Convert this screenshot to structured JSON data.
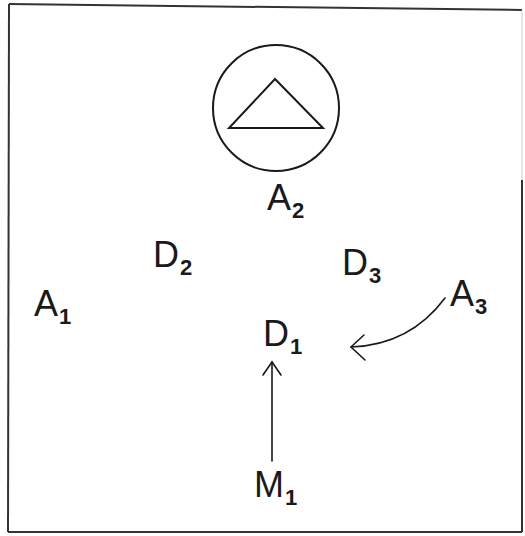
{
  "diagram": {
    "frame": {
      "stroke": "#333333"
    },
    "colors": {
      "ink": "#1a1a1a",
      "background": "#ffffff"
    },
    "symbol": {
      "name": "triangle-in-circle",
      "circle": {
        "cx": 276,
        "cy": 108,
        "r": 63
      },
      "triangle": {
        "apex": [
          275,
          79
        ],
        "left": [
          229,
          128
        ],
        "right": [
          323,
          128
        ]
      }
    },
    "labels": [
      {
        "id": "A2",
        "main": "A",
        "sub": "2",
        "x": 267,
        "y": 180
      },
      {
        "id": "D2",
        "main": "D",
        "sub": "2",
        "x": 153,
        "y": 237
      },
      {
        "id": "D3",
        "main": "D",
        "sub": "3",
        "x": 342,
        "y": 245
      },
      {
        "id": "A1",
        "main": "A",
        "sub": "1",
        "x": 34,
        "y": 286
      },
      {
        "id": "A3",
        "main": "A",
        "sub": "3",
        "x": 450,
        "y": 276
      },
      {
        "id": "D1",
        "main": "D",
        "sub": "1",
        "x": 263,
        "y": 316
      },
      {
        "id": "M1",
        "main": "M",
        "sub": "1",
        "x": 254,
        "y": 467
      }
    ],
    "arrows": [
      {
        "name": "arrow-A3-to-D1",
        "from": "A3",
        "to": "D1",
        "type": "curved"
      },
      {
        "name": "arrow-M1-to-D1",
        "from": "M1",
        "to": "D1",
        "type": "straight"
      }
    ]
  }
}
